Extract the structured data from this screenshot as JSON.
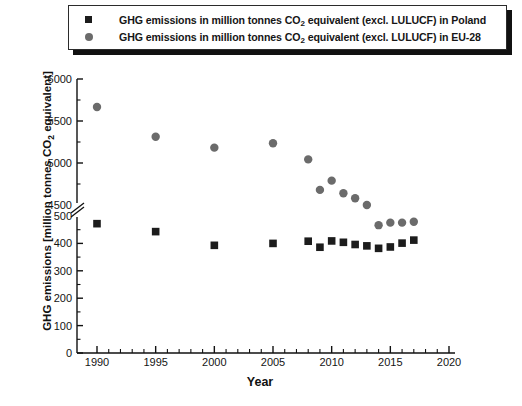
{
  "legend": {
    "entries": [
      {
        "marker": "square-marker",
        "marker_color": "#1c1c1c",
        "text_before": "GHG emissions in million tonnes CO",
        "sub": "2",
        "text_after": " equivalent (excl. LULUCF) in Poland"
      },
      {
        "marker": "circle-marker",
        "marker_color": "#6b6b6b",
        "text_before": "GHG emissions in million tonnes CO",
        "sub": "2",
        "text_after": " equivalent (excl. LULUCF) in EU-28"
      }
    ]
  },
  "axes": {
    "xlabel": "Year",
    "ylabel_before": "GHG emissions [million tonnes CO",
    "ylabel_sub": "2",
    "ylabel_after": " equivalent]",
    "x_ticks": [
      "1990",
      "1995",
      "2000",
      "2005",
      "2010",
      "2015",
      "2020"
    ],
    "y_ticks": [
      "6000",
      "5500",
      "5000",
      "4500",
      "500",
      "400",
      "300",
      "200",
      "100",
      "0"
    ],
    "axis_break": true
  },
  "chart_data": {
    "type": "scatter",
    "title": "",
    "xlabel": "Year",
    "ylabel": "GHG emissions [million tonnes CO2 equivalent]",
    "xlim": [
      1988,
      2020
    ],
    "grid": false,
    "legend_position": "top",
    "y_axis_note": "Broken y-axis: lower segment 0-500, upper segment 4500-6000",
    "y_segments": [
      {
        "min": 0,
        "max": 500,
        "ticks": [
          0,
          100,
          200,
          300,
          400,
          500
        ]
      },
      {
        "min": 4500,
        "max": 6000,
        "ticks": [
          4500,
          5000,
          5500,
          6000
        ]
      }
    ],
    "series": [
      {
        "name": "GHG emissions in million tonnes CO2 equivalent (excl. LULUCF) in Poland",
        "marker": "square",
        "color": "#1c1c1c",
        "x": [
          1990,
          1995,
          2000,
          2005,
          2008,
          2009,
          2010,
          2011,
          2012,
          2013,
          2014,
          2015,
          2016,
          2017
        ],
        "y": [
          472,
          443,
          393,
          400,
          408,
          386,
          409,
          404,
          396,
          391,
          382,
          387,
          401,
          412
        ]
      },
      {
        "name": "GHG emissions in million tonnes CO2 equivalent (excl. LULUCF) in EU-28",
        "marker": "circle",
        "color": "#6b6b6b",
        "x": [
          1990,
          1995,
          2000,
          2005,
          2008,
          2009,
          2010,
          2011,
          2012,
          2013,
          2014,
          2015,
          2016,
          2017
        ],
        "y": [
          5667,
          5312,
          5183,
          5235,
          5043,
          4680,
          4790,
          4640,
          4580,
          4500,
          4260,
          4290,
          4290,
          4300
        ]
      }
    ]
  }
}
